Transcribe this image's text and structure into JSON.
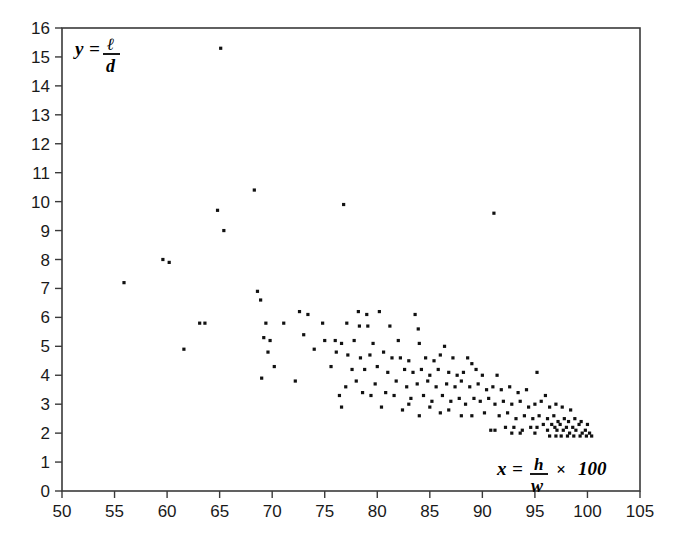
{
  "chart_data": {
    "type": "scatter",
    "title": "",
    "xlabel": "x = h/w × 100",
    "ylabel": "y = ℓ/d",
    "xlabel_parts": {
      "lhs": "x",
      "eq": "=",
      "num": "h",
      "den": "w",
      "times": "×",
      "factor": "100"
    },
    "ylabel_parts": {
      "lhs": "y",
      "eq": "=",
      "num": "ℓ",
      "den": "d"
    },
    "xlim": [
      50,
      105
    ],
    "ylim": [
      0,
      16
    ],
    "xticks": [
      50,
      55,
      60,
      65,
      70,
      75,
      80,
      85,
      90,
      95,
      100,
      105
    ],
    "yticks": [
      0,
      1,
      2,
      3,
      4,
      5,
      6,
      7,
      8,
      9,
      10,
      11,
      12,
      13,
      14,
      15,
      16
    ],
    "xtick_labels": [
      "50",
      "55",
      "60",
      "65",
      "70",
      "75",
      "80",
      "85",
      "90",
      "95",
      "100",
      "105"
    ],
    "ytick_labels": [
      "0",
      "1",
      "2",
      "3",
      "4",
      "5",
      "6",
      "7",
      "8",
      "9",
      "10",
      "11",
      "12",
      "13",
      "14",
      "15",
      "16"
    ],
    "grid": false,
    "legend": null,
    "marker": {
      "shape": "square",
      "size_px": 3.2,
      "color": "#111111"
    },
    "point_count": 175,
    "points": [
      [
        65.1,
        15.3
      ],
      [
        68.3,
        10.4
      ],
      [
        76.8,
        9.9
      ],
      [
        91.1,
        9.6
      ],
      [
        64.8,
        9.7
      ],
      [
        65.4,
        9.0
      ],
      [
        59.6,
        8.0
      ],
      [
        60.2,
        7.9
      ],
      [
        55.9,
        7.2
      ],
      [
        68.6,
        6.9
      ],
      [
        68.9,
        6.6
      ],
      [
        72.6,
        6.2
      ],
      [
        73.4,
        6.1
      ],
      [
        78.2,
        6.2
      ],
      [
        79.0,
        6.1
      ],
      [
        80.2,
        6.2
      ],
      [
        83.6,
        6.1
      ],
      [
        63.1,
        5.8
      ],
      [
        63.6,
        5.8
      ],
      [
        69.4,
        5.8
      ],
      [
        71.1,
        5.8
      ],
      [
        74.8,
        5.8
      ],
      [
        77.1,
        5.8
      ],
      [
        78.3,
        5.7
      ],
      [
        79.1,
        5.7
      ],
      [
        81.2,
        5.7
      ],
      [
        83.9,
        5.6
      ],
      [
        69.2,
        5.3
      ],
      [
        69.8,
        5.2
      ],
      [
        73.0,
        5.4
      ],
      [
        75.0,
        5.2
      ],
      [
        76.0,
        5.2
      ],
      [
        76.6,
        5.1
      ],
      [
        77.8,
        5.2
      ],
      [
        79.6,
        5.1
      ],
      [
        82.0,
        5.2
      ],
      [
        84.0,
        5.1
      ],
      [
        86.4,
        5.0
      ],
      [
        61.6,
        4.9
      ],
      [
        69.6,
        4.8
      ],
      [
        74.0,
        4.9
      ],
      [
        76.1,
        4.8
      ],
      [
        77.2,
        4.7
      ],
      [
        78.4,
        4.6
      ],
      [
        79.3,
        4.7
      ],
      [
        80.6,
        4.8
      ],
      [
        81.4,
        4.6
      ],
      [
        82.2,
        4.6
      ],
      [
        83.0,
        4.5
      ],
      [
        84.6,
        4.6
      ],
      [
        85.4,
        4.5
      ],
      [
        86.0,
        4.7
      ],
      [
        87.2,
        4.6
      ],
      [
        88.6,
        4.6
      ],
      [
        89.0,
        4.4
      ],
      [
        70.2,
        4.3
      ],
      [
        75.6,
        4.3
      ],
      [
        77.6,
        4.2
      ],
      [
        78.8,
        4.2
      ],
      [
        80.0,
        4.3
      ],
      [
        81.0,
        4.1
      ],
      [
        82.6,
        4.2
      ],
      [
        83.4,
        4.1
      ],
      [
        84.2,
        4.2
      ],
      [
        85.0,
        4.0
      ],
      [
        85.8,
        4.2
      ],
      [
        86.8,
        4.1
      ],
      [
        87.6,
        4.0
      ],
      [
        88.2,
        4.1
      ],
      [
        89.4,
        4.2
      ],
      [
        90.0,
        4.0
      ],
      [
        91.4,
        4.0
      ],
      [
        95.2,
        4.1
      ],
      [
        69.0,
        3.9
      ],
      [
        72.2,
        3.8
      ],
      [
        78.0,
        3.8
      ],
      [
        79.8,
        3.7
      ],
      [
        81.8,
        3.8
      ],
      [
        82.8,
        3.6
      ],
      [
        83.8,
        3.7
      ],
      [
        84.8,
        3.8
      ],
      [
        85.6,
        3.6
      ],
      [
        86.6,
        3.7
      ],
      [
        87.4,
        3.6
      ],
      [
        88.0,
        3.8
      ],
      [
        88.8,
        3.6
      ],
      [
        89.6,
        3.7
      ],
      [
        90.4,
        3.5
      ],
      [
        91.0,
        3.6
      ],
      [
        91.8,
        3.5
      ],
      [
        92.6,
        3.6
      ],
      [
        93.4,
        3.4
      ],
      [
        94.2,
        3.5
      ],
      [
        96.0,
        3.3
      ],
      [
        76.4,
        3.3
      ],
      [
        79.4,
        3.3
      ],
      [
        81.6,
        3.3
      ],
      [
        83.2,
        3.2
      ],
      [
        84.4,
        3.3
      ],
      [
        85.2,
        3.1
      ],
      [
        86.2,
        3.3
      ],
      [
        87.0,
        3.1
      ],
      [
        87.8,
        3.2
      ],
      [
        88.4,
        3.0
      ],
      [
        89.2,
        3.2
      ],
      [
        89.8,
        3.1
      ],
      [
        90.6,
        3.2
      ],
      [
        91.2,
        3.0
      ],
      [
        92.0,
        3.1
      ],
      [
        92.8,
        3.0
      ],
      [
        93.6,
        3.1
      ],
      [
        94.4,
        2.9
      ],
      [
        95.0,
        3.0
      ],
      [
        95.6,
        3.1
      ],
      [
        96.4,
        2.9
      ],
      [
        97.0,
        3.0
      ],
      [
        97.6,
        2.9
      ],
      [
        98.4,
        2.8
      ],
      [
        76.6,
        2.9
      ],
      [
        80.4,
        2.9
      ],
      [
        82.4,
        2.8
      ],
      [
        84.0,
        2.6
      ],
      [
        86.0,
        2.7
      ],
      [
        88.0,
        2.6
      ],
      [
        89.0,
        2.6
      ],
      [
        90.2,
        2.7
      ],
      [
        91.6,
        2.6
      ],
      [
        92.4,
        2.7
      ],
      [
        93.2,
        2.5
      ],
      [
        94.0,
        2.6
      ],
      [
        94.8,
        2.5
      ],
      [
        95.4,
        2.6
      ],
      [
        96.2,
        2.5
      ],
      [
        96.8,
        2.6
      ],
      [
        97.2,
        2.4
      ],
      [
        97.8,
        2.5
      ],
      [
        98.2,
        2.4
      ],
      [
        98.8,
        2.5
      ],
      [
        99.4,
        2.4
      ],
      [
        100.0,
        2.3
      ],
      [
        91.2,
        2.1
      ],
      [
        92.2,
        2.2
      ],
      [
        93.0,
        2.2
      ],
      [
        93.8,
        2.1
      ],
      [
        94.6,
        2.2
      ],
      [
        95.2,
        2.2
      ],
      [
        95.8,
        2.3
      ],
      [
        96.2,
        2.1
      ],
      [
        96.6,
        2.3
      ],
      [
        96.9,
        2.2
      ],
      [
        97.1,
        2.1
      ],
      [
        97.4,
        2.3
      ],
      [
        97.7,
        2.1
      ],
      [
        98.0,
        2.2
      ],
      [
        98.3,
        2.0
      ],
      [
        98.6,
        2.2
      ],
      [
        98.9,
        2.1
      ],
      [
        99.2,
        2.3
      ],
      [
        99.5,
        2.0
      ],
      [
        99.8,
        2.1
      ],
      [
        100.2,
        2.0
      ],
      [
        96.4,
        1.9
      ],
      [
        97.0,
        1.9
      ],
      [
        97.5,
        1.9
      ],
      [
        98.1,
        1.9
      ],
      [
        98.7,
        1.9
      ],
      [
        99.3,
        1.9
      ],
      [
        99.9,
        1.9
      ],
      [
        100.4,
        1.9
      ],
      [
        95.0,
        2.0
      ],
      [
        93.6,
        2.0
      ],
      [
        92.8,
        2.0
      ],
      [
        90.8,
        2.1
      ],
      [
        86.8,
        2.8
      ],
      [
        85.0,
        2.9
      ],
      [
        83.0,
        3.0
      ],
      [
        80.8,
        3.4
      ],
      [
        78.6,
        3.4
      ],
      [
        77.0,
        3.6
      ]
    ]
  }
}
